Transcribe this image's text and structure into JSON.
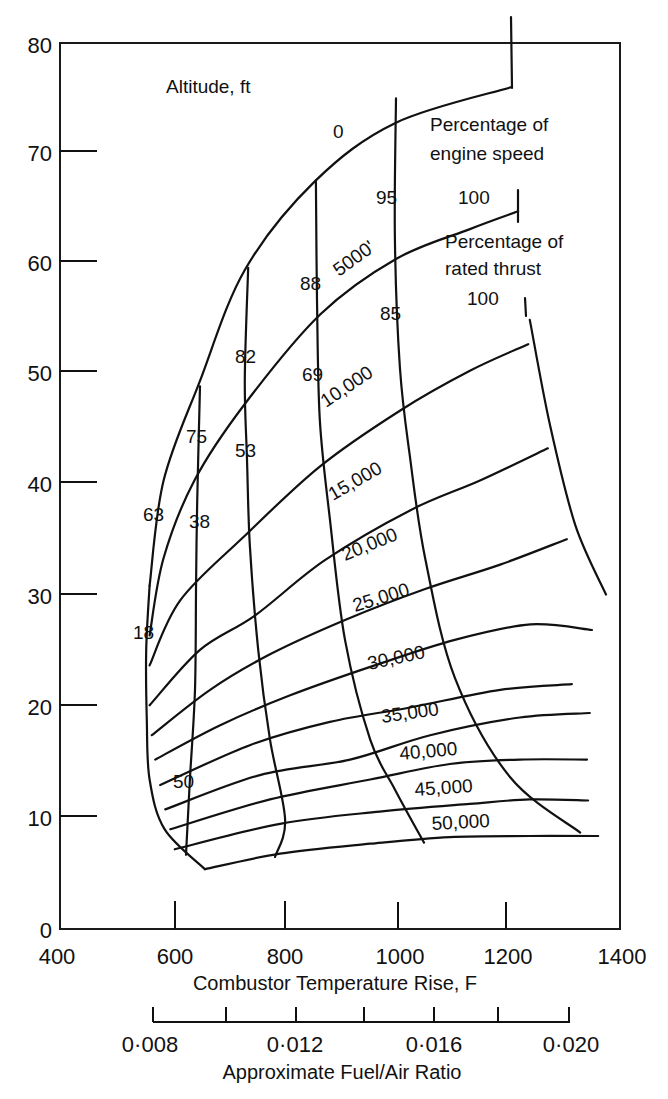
{
  "chart_data": {
    "type": "line",
    "title": "",
    "xlabel": "Combustor Temperature Rise, F",
    "ylabel": "",
    "xlim": [
      400,
      1400
    ],
    "ylim": [
      0,
      80
    ],
    "grid": false,
    "x_ticks": [
      400,
      600,
      800,
      1000,
      1200,
      1400
    ],
    "y_ticks": [
      0,
      10,
      20,
      30,
      40,
      50,
      60,
      70,
      80
    ],
    "secondary_x_axis": {
      "label": "Approximate Fuel/Air Ratio",
      "ticks": [
        "0·008",
        "0·010",
        "0·012",
        "0·014",
        "0·016",
        "0·018",
        "0·020"
      ],
      "labels": [
        "0·008",
        "0·012",
        "0·016",
        "0·020"
      ]
    },
    "annotations": [
      "Altitude, ft",
      "Percentage of engine speed",
      "Percentage of rated thrust"
    ],
    "altitude_series": [
      {
        "name": "0",
        "points": [
          [
            560,
            31
          ],
          [
            585,
            40.5
          ],
          [
            650,
            49.5
          ],
          [
            730,
            59.5
          ],
          [
            855,
            67.5
          ],
          [
            1000,
            72.8
          ],
          [
            1205,
            76
          ]
        ]
      },
      {
        "name": "5000'",
        "points": [
          [
            560,
            26.5
          ],
          [
            585,
            33.5
          ],
          [
            640,
            40.5
          ],
          [
            730,
            47.4
          ],
          [
            865,
            55.5
          ],
          [
            1000,
            60.5
          ],
          [
            1132,
            63.2
          ],
          [
            1218,
            64.8
          ]
        ]
      },
      {
        "name": "10,000",
        "points": [
          [
            560,
            23.8
          ],
          [
            615,
            29.7
          ],
          [
            730,
            35.5
          ],
          [
            865,
            41.8
          ],
          [
            1007,
            46.8
          ],
          [
            1132,
            50.4
          ],
          [
            1236,
            52.8
          ]
        ]
      },
      {
        "name": "15,000",
        "points": [
          [
            560,
            20.2
          ],
          [
            650,
            25.2
          ],
          [
            748,
            28.3
          ],
          [
            873,
            33.3
          ],
          [
            1025,
            37.8
          ],
          [
            1150,
            40.5
          ],
          [
            1271,
            43.4
          ]
        ]
      },
      {
        "name": "20,000",
        "points": [
          [
            564,
            17.5
          ],
          [
            668,
            21.6
          ],
          [
            775,
            24.8
          ],
          [
            909,
            27.9
          ],
          [
            1052,
            30.7
          ],
          [
            1186,
            32.9
          ],
          [
            1305,
            35.2
          ]
        ]
      },
      {
        "name": "25,000",
        "points": [
          [
            570,
            15.3
          ],
          [
            686,
            18.4
          ],
          [
            811,
            21.1
          ],
          [
            962,
            23.8
          ],
          [
            1105,
            26.1
          ],
          [
            1240,
            27.5
          ],
          [
            1350,
            27
          ]
        ]
      },
      {
        "name": "30,000",
        "points": [
          [
            579,
            13
          ],
          [
            739,
            16.6
          ],
          [
            882,
            18.7
          ],
          [
            1025,
            20
          ],
          [
            1186,
            21.6
          ],
          [
            1314,
            22.1
          ]
        ]
      },
      {
        "name": "35,000",
        "points": [
          [
            588,
            10.8
          ],
          [
            757,
            13.9
          ],
          [
            918,
            15.3
          ],
          [
            1061,
            17.5
          ],
          [
            1221,
            19.1
          ],
          [
            1346,
            19.5
          ]
        ]
      },
      {
        "name": "40,000",
        "points": [
          [
            597,
            9
          ],
          [
            775,
            11.7
          ],
          [
            954,
            13.5
          ],
          [
            1096,
            14.9
          ],
          [
            1221,
            15.3
          ],
          [
            1341,
            15.3
          ]
        ]
      },
      {
        "name": "45,000",
        "points": [
          [
            605,
            7.2
          ],
          [
            793,
            9.5
          ],
          [
            971,
            10.6
          ],
          [
            1132,
            11.3
          ],
          [
            1239,
            11.7
          ],
          [
            1343,
            11.6
          ]
        ]
      },
      {
        "name": "50,000",
        "points": [
          [
            659,
            5.4
          ],
          [
            793,
            6.8
          ],
          [
            954,
            7.7
          ],
          [
            1096,
            8.3
          ],
          [
            1239,
            8.4
          ],
          [
            1361,
            8.4
          ]
        ]
      }
    ],
    "engine_speed_series": [
      {
        "speed_pct": "63",
        "thrust_pct": "18",
        "points": [
          [
            560,
            31
          ],
          [
            554,
            25.2
          ],
          [
            555,
            18.9
          ],
          [
            560,
            13.5
          ],
          [
            587,
            9
          ],
          [
            659,
            5.4
          ]
        ]
      },
      {
        "speed_pct": "75",
        "thrust_pct": "38",
        "points": [
          [
            650,
            49
          ],
          [
            645,
            38.6
          ],
          [
            643,
            31.4
          ],
          [
            641,
            21.6
          ],
          [
            632,
            13.5
          ],
          [
            625,
            6.7
          ]
        ]
      },
      {
        "speed_pct": "82",
        "thrust_pct": "53",
        "points": [
          [
            736,
            59.7
          ],
          [
            730,
            49.6
          ],
          [
            734,
            42.4
          ],
          [
            739,
            34.7
          ],
          [
            754,
            25.2
          ],
          [
            775,
            17.1
          ],
          [
            802,
            9.9
          ],
          [
            784,
            6.5
          ]
        ]
      },
      {
        "speed_pct": "88",
        "thrust_pct": "69",
        "points": [
          [
            857,
            67.6
          ],
          [
            859,
            56.8
          ],
          [
            864,
            46
          ],
          [
            882,
            37
          ],
          [
            909,
            26.1
          ],
          [
            954,
            17.1
          ],
          [
            998,
            12.6
          ],
          [
            1050,
            7.8
          ]
        ]
      },
      {
        "speed_pct": "95",
        "thrust_pct": "85",
        "points": [
          [
            1000,
            75
          ],
          [
            998,
            62.4
          ],
          [
            1007,
            50.7
          ],
          [
            1025,
            42.6
          ],
          [
            1052,
            33.5
          ],
          [
            1105,
            22.7
          ],
          [
            1204,
            13.7
          ],
          [
            1329,
            8.7
          ]
        ]
      },
      {
        "speed_pct": "100",
        "thrust_pct": "100",
        "points": [
          [
            1239,
            55
          ],
          [
            1275,
            45.5
          ],
          [
            1320,
            36.5
          ],
          [
            1375,
            30.2
          ]
        ]
      }
    ],
    "lowest_curve_label": "50"
  },
  "labels": {
    "altitude_title": "Altitude, ft",
    "speed_title_1": "Percentage of",
    "speed_title_2": "engine speed",
    "thrust_title_1": "Percentage of",
    "thrust_title_2": "rated thrust",
    "alt_0": "0",
    "alt_5000": "5000'",
    "alt_10000": "10,000",
    "alt_15000": "15,000",
    "alt_20000": "20,000",
    "alt_25000": "25,000",
    "alt_30000": "30,000",
    "alt_35000": "35,000",
    "alt_40000": "40,000",
    "alt_45000": "45,000",
    "alt_50000": "50,000",
    "speed_63": "63",
    "speed_75": "75",
    "speed_82": "82",
    "speed_88": "88",
    "speed_95": "95",
    "speed_100": "100",
    "thrust_18": "18",
    "thrust_38": "38",
    "thrust_53": "53",
    "thrust_69": "69",
    "thrust_85": "85",
    "thrust_100": "100",
    "thrust_50": "50"
  },
  "axes": {
    "y_ticks": [
      "80",
      "70",
      "60",
      "50",
      "40",
      "30",
      "20",
      "10",
      "0"
    ],
    "x_ticks": [
      "400",
      "600",
      "800",
      "1000",
      "1200",
      "1400"
    ],
    "x_title": "Combustor Temperature Rise, F",
    "fa_ticks": [
      "0·008",
      "0·012",
      "0·016",
      "0·020"
    ],
    "fa_title": "Approximate Fuel/Air Ratio"
  }
}
